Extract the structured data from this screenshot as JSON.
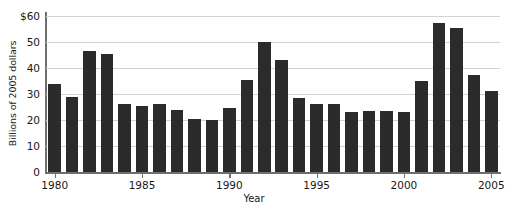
{
  "chart_data": {
    "type": "bar",
    "title": "",
    "xlabel": "Year",
    "ylabel": "Billions of 2005 dollars",
    "categories": [
      1980,
      1981,
      1982,
      1983,
      1984,
      1985,
      1986,
      1987,
      1988,
      1989,
      1990,
      1991,
      1992,
      1993,
      1994,
      1995,
      1996,
      1997,
      1998,
      1999,
      2000,
      2001,
      2002,
      2003,
      2004,
      2005
    ],
    "values": [
      34,
      29,
      46.5,
      45.5,
      26,
      25.5,
      26,
      24,
      20.5,
      20,
      24.5,
      35.5,
      50,
      43,
      28.5,
      26,
      26,
      23,
      23.5,
      23.5,
      23,
      35,
      57.5,
      55.5,
      37.5,
      31
    ],
    "ylim": [
      0,
      60
    ],
    "yticks": [
      0,
      10,
      20,
      30,
      40,
      50,
      60
    ],
    "ytick_labels": [
      "0",
      "10",
      "20",
      "30",
      "40",
      "50",
      "$60"
    ],
    "xticks": [
      1980,
      1985,
      1990,
      1995,
      2000,
      2005
    ],
    "xtick_labels": [
      "1980",
      "1985",
      "1990",
      "1995",
      "2000",
      "2005"
    ],
    "grid": true,
    "legend": null,
    "bar_color": "#2b2b2b",
    "grid_color": "#d2d2d2",
    "axis_color": "#6f6f6f"
  }
}
